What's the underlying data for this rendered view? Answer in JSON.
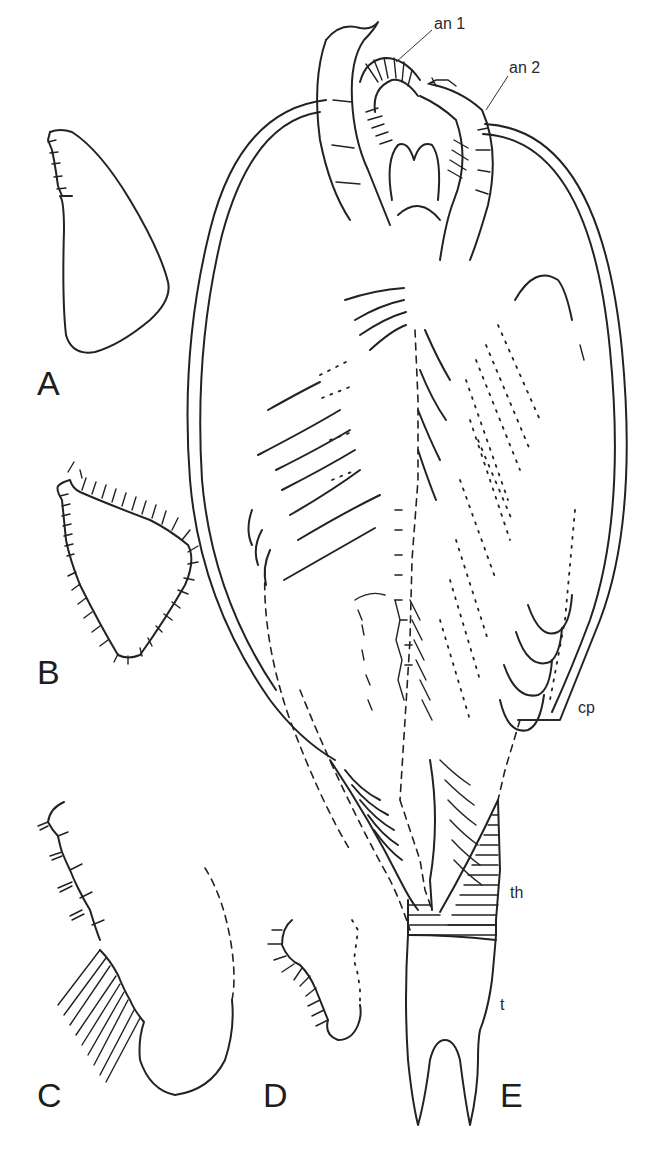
{
  "figure": {
    "panels": [
      {
        "id": "A",
        "label": "A",
        "content": "limb outline with segmented endite"
      },
      {
        "id": "B",
        "label": "B",
        "content": "limb outline with marginal setae"
      },
      {
        "id": "C",
        "label": "C",
        "content": "limb with spinose endites and setae"
      },
      {
        "id": "D",
        "label": "D",
        "content": "small limb with spinose margin"
      },
      {
        "id": "E",
        "label": "E",
        "content": "whole animal, ventral view"
      }
    ],
    "annotations": {
      "an1": "an 1",
      "an2": "an 2",
      "cp": "cp",
      "th": "th",
      "t": "t"
    },
    "colors": {
      "ink": "#222222",
      "background": "#ffffff"
    }
  }
}
